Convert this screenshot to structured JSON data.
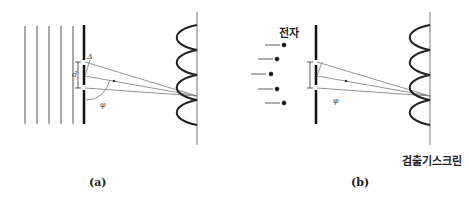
{
  "panels": [
    {
      "id": "a",
      "caption": "(a)",
      "labels": {
        "delta": "Δ",
        "d": "d",
        "phi": "φ"
      },
      "source": "plane waves",
      "wavefront_count": 5
    },
    {
      "id": "b",
      "caption": "(b)",
      "labels": {
        "phi": "φ",
        "electron": "전자",
        "screen": "검출기스크린"
      },
      "source": "electrons",
      "electron_count": 5
    }
  ],
  "colors": {
    "line": "#333333",
    "ray": "#777777",
    "barrier": "#111111"
  }
}
